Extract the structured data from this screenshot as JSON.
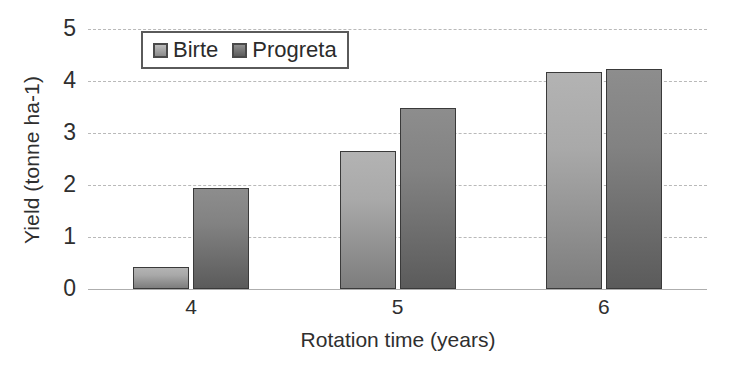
{
  "chart_data": {
    "type": "bar",
    "title": "",
    "xlabel": "Rotation time (years)",
    "ylabel": "Yield (tonne ha-1)",
    "categories": [
      "4",
      "5",
      "6"
    ],
    "series": [
      {
        "name": "Birte",
        "values": [
          0.43,
          2.65,
          4.18
        ],
        "color": "#a0a0a0"
      },
      {
        "name": "Progreta",
        "values": [
          1.95,
          3.48,
          4.23
        ],
        "color": "#6f6f6f"
      }
    ],
    "ylim": [
      0,
      5
    ],
    "yticks": [
      "0",
      "1",
      "2",
      "3",
      "4",
      "5"
    ],
    "grid": true,
    "legend_position": "top-left-inside"
  },
  "legend": {
    "entries": [
      {
        "label": "Birte"
      },
      {
        "label": "Progreta"
      }
    ]
  },
  "axes": {
    "y_title": "Yield (tonne ha-1)",
    "x_title": "Rotation time (years)",
    "y_tick_labels": [
      "0",
      "1",
      "2",
      "3",
      "4",
      "5"
    ],
    "x_tick_labels": [
      "4",
      "5",
      "6"
    ]
  },
  "colors": {
    "birte": "#a0a0a0",
    "progreta": "#6f6f6f",
    "gridline": "#b9b9b9",
    "bar_border": "#3a3a3a",
    "text": "#2f2f2f"
  }
}
